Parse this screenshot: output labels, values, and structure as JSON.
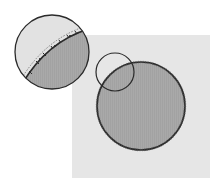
{
  "figure": {
    "colors": {
      "background": "#ffffff",
      "square_fill": "#e6e6e6",
      "disk_fill": "#a8a8a8",
      "outline": "#2a2a2a",
      "lens_fill": "#e2e2e2",
      "dashed_line": "#777777"
    },
    "square": {
      "x": 72,
      "y": 35,
      "width": 138,
      "height": 143
    },
    "large_circle": {
      "cx": 141,
      "cy": 106,
      "r": 44
    },
    "focus_circle": {
      "cx": 115,
      "cy": 72,
      "r": 19
    },
    "magnified_circle": {
      "cx": 52,
      "cy": 52,
      "r": 37
    }
  }
}
